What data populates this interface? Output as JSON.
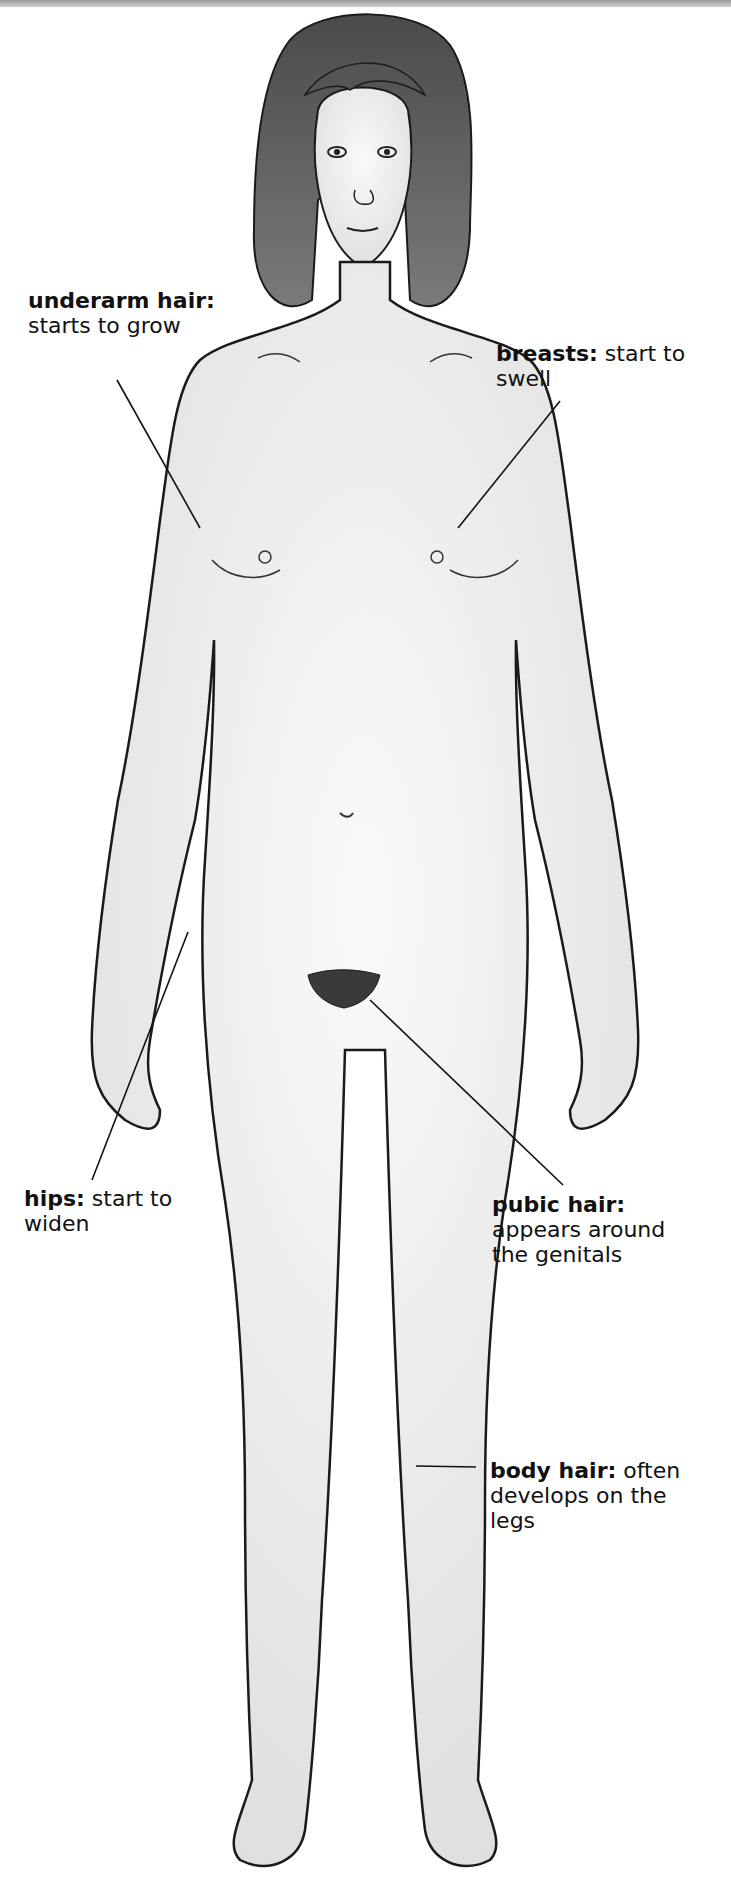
{
  "diagram": {
    "colors": {
      "skin": "#f1f1f1",
      "outline": "#1a1a1a",
      "hair": "#5a5a5a",
      "leader_line": "#111111"
    },
    "labels": [
      {
        "id": "underarm",
        "term": "underarm hair:",
        "line1_rest": "",
        "line2": "starts to grow",
        "line3": ""
      },
      {
        "id": "breasts",
        "term": "breasts:",
        "line1_rest": " start to",
        "line2": "swell",
        "line3": ""
      },
      {
        "id": "hips",
        "term": "hips:",
        "line1_rest": " start to",
        "line2": "widen",
        "line3": ""
      },
      {
        "id": "pubic",
        "term": "pubic hair:",
        "line1_rest": "",
        "line2": "appears around",
        "line3": "the genitals"
      },
      {
        "id": "body",
        "term": "body hair:",
        "line1_rest": " often",
        "line2": "develops on the",
        "line3": "legs"
      }
    ]
  }
}
